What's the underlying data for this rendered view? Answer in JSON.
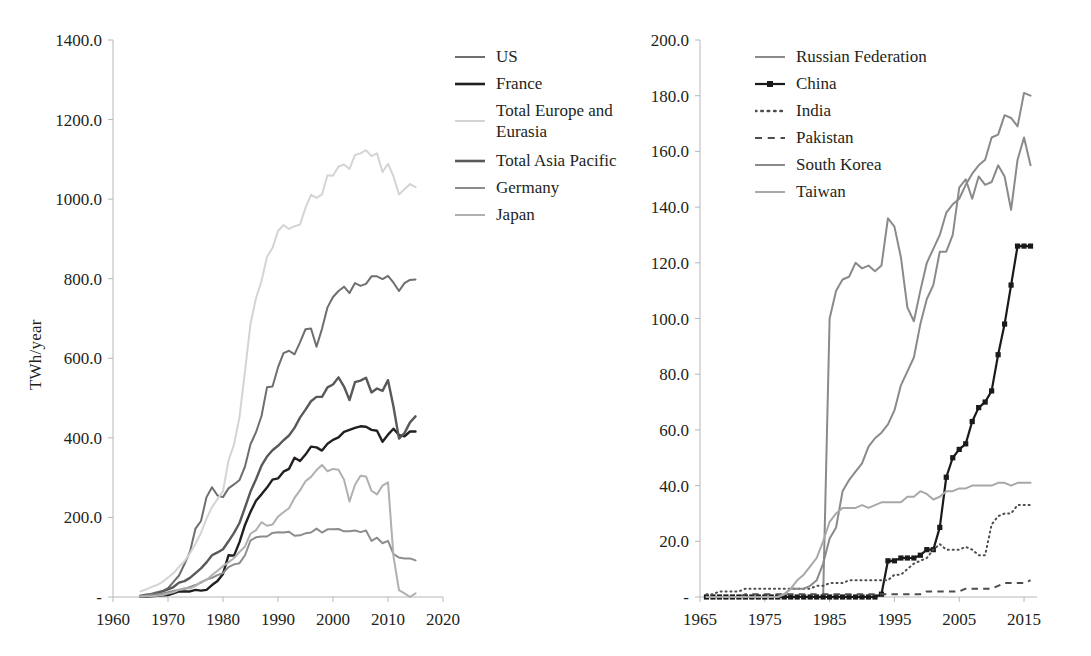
{
  "chart_data": [
    {
      "id": "left",
      "type": "line",
      "title": "",
      "xlabel": "",
      "ylabel": "TWh/year",
      "xlim": [
        1960,
        2020
      ],
      "ylim": [
        0,
        1400
      ],
      "xticks": [
        "1960",
        "1970",
        "1980",
        "1990",
        "2000",
        "2010",
        "2020"
      ],
      "xtick_values": [
        1960,
        1970,
        1980,
        1990,
        2000,
        2010,
        2020
      ],
      "yticks": [
        "-",
        "200.0",
        "400.0",
        "600.0",
        "800.0",
        "1000.0",
        "1200.0",
        "1400.0"
      ],
      "ytick_values": [
        0,
        200,
        400,
        600,
        800,
        1000,
        1200,
        1400
      ],
      "grid": false,
      "legend_position": "right",
      "x": [
        1965,
        1966,
        1967,
        1968,
        1969,
        1970,
        1971,
        1972,
        1973,
        1974,
        1975,
        1976,
        1977,
        1978,
        1979,
        1980,
        1981,
        1982,
        1983,
        1984,
        1985,
        1986,
        1987,
        1988,
        1989,
        1990,
        1991,
        1992,
        1993,
        1994,
        1995,
        1996,
        1997,
        1998,
        1999,
        2000,
        2001,
        2002,
        2003,
        2004,
        2005,
        2006,
        2007,
        2008,
        2009,
        2010,
        2011,
        2012,
        2013,
        2014,
        2015
      ],
      "series": [
        {
          "name": "US",
          "color": "#6e6e6e",
          "width": 2.0,
          "style": "solid",
          "values": [
            4,
            6,
            8,
            12,
            15,
            22,
            38,
            54,
            83,
            114,
            172,
            191,
            251,
            276,
            255,
            251,
            273,
            283,
            294,
            328,
            384,
            414,
            455,
            527,
            529,
            577,
            613,
            619,
            610,
            640,
            673,
            675,
            629,
            674,
            728,
            754,
            769,
            780,
            764,
            789,
            782,
            787,
            806,
            806,
            799,
            807,
            790,
            769,
            789,
            797,
            798
          ]
        },
        {
          "name": "France",
          "color": "#231f20",
          "width": 2.4,
          "style": "solid",
          "values": [
            1,
            1,
            2,
            3,
            4,
            5,
            9,
            14,
            14,
            14,
            18,
            16,
            18,
            30,
            40,
            58,
            105,
            104,
            138,
            181,
            214,
            242,
            258,
            275,
            295,
            298,
            315,
            322,
            350,
            342,
            358,
            378,
            376,
            368,
            385,
            395,
            401,
            415,
            420,
            425,
            429,
            428,
            420,
            418,
            390,
            408,
            423,
            407,
            404,
            416,
            416
          ]
        },
        {
          "name": "Total Europe and Eurasia",
          "color": "#d4d4d4",
          "width": 2.0,
          "style": "solid",
          "values": [
            14,
            19,
            25,
            30,
            38,
            49,
            60,
            76,
            90,
            110,
            134,
            161,
            197,
            226,
            246,
            266,
            343,
            383,
            452,
            568,
            687,
            751,
            794,
            855,
            877,
            920,
            935,
            925,
            932,
            936,
            978,
            1011,
            1003,
            1012,
            1060,
            1059,
            1082,
            1087,
            1076,
            1111,
            1115,
            1123,
            1108,
            1115,
            1068,
            1089,
            1057,
            1012,
            1025,
            1038,
            1030
          ]
        },
        {
          "name": "Total Asia Pacific",
          "color": "#595959",
          "width": 2.4,
          "style": "solid",
          "values": [
            1,
            2,
            5,
            9,
            14,
            19,
            25,
            36,
            40,
            48,
            60,
            72,
            87,
            105,
            112,
            120,
            140,
            161,
            186,
            225,
            265,
            296,
            330,
            353,
            369,
            380,
            394,
            406,
            425,
            451,
            471,
            492,
            503,
            503,
            527,
            534,
            552,
            529,
            495,
            540,
            544,
            551,
            514,
            524,
            518,
            545,
            478,
            398,
            412,
            439,
            454
          ]
        },
        {
          "name": "Germany",
          "color": "#8c8c8c",
          "width": 2.0,
          "style": "solid",
          "values": [
            2,
            3,
            5,
            7,
            9,
            12,
            15,
            18,
            20,
            25,
            30,
            36,
            44,
            48,
            55,
            60,
            75,
            82,
            85,
            105,
            142,
            150,
            152,
            152,
            161,
            163,
            162,
            164,
            154,
            155,
            160,
            162,
            172,
            162,
            170,
            170,
            171,
            165,
            165,
            167,
            163,
            167,
            141,
            149,
            135,
            141,
            108,
            99,
            97,
            97,
            92
          ]
        },
        {
          "name": "Japan",
          "color": "#b0b0b0",
          "width": 2.0,
          "style": "solid",
          "values": [
            1,
            2,
            2,
            3,
            5,
            9,
            12,
            18,
            22,
            22,
            28,
            38,
            43,
            55,
            66,
            78,
            87,
            98,
            113,
            127,
            159,
            168,
            188,
            179,
            182,
            202,
            213,
            223,
            249,
            268,
            291,
            302,
            319,
            332,
            316,
            322,
            320,
            295,
            240,
            282,
            305,
            303,
            267,
            258,
            280,
            288,
            102,
            17,
            9,
            0,
            9
          ]
        }
      ]
    },
    {
      "id": "right",
      "type": "line",
      "title": "",
      "xlabel": "",
      "ylabel": "",
      "xlim": [
        1965,
        2017
      ],
      "ylim": [
        0,
        200
      ],
      "xticks": [
        "1965",
        "1975",
        "1985",
        "1995",
        "2005",
        "2015"
      ],
      "xtick_values": [
        1965,
        1975,
        1985,
        1995,
        2005,
        2015
      ],
      "yticks": [
        "-",
        "20.0",
        "40.0",
        "60.0",
        "80.0",
        "100.0",
        "120.0",
        "140.0",
        "160.0",
        "180.0",
        "200.0"
      ],
      "ytick_values": [
        0,
        20,
        40,
        60,
        80,
        100,
        120,
        140,
        160,
        180,
        200
      ],
      "grid": false,
      "legend_position": "right",
      "x": [
        1966,
        1967,
        1968,
        1969,
        1970,
        1971,
        1972,
        1973,
        1974,
        1975,
        1976,
        1977,
        1978,
        1979,
        1980,
        1981,
        1982,
        1983,
        1984,
        1985,
        1986,
        1987,
        1988,
        1989,
        1990,
        1991,
        1992,
        1993,
        1994,
        1995,
        1996,
        1997,
        1998,
        1999,
        2000,
        2001,
        2002,
        2003,
        2004,
        2005,
        2006,
        2007,
        2008,
        2009,
        2010,
        2011,
        2012,
        2013,
        2014,
        2015,
        2016
      ],
      "series": [
        {
          "name": "Russian Federation",
          "color": "#8a8a8a",
          "width": 2.0,
          "style": "solid",
          "markers": false,
          "values": [
            0,
            0,
            0,
            0,
            0,
            0,
            0,
            0,
            0,
            0,
            0,
            0,
            0,
            0,
            0,
            0,
            0,
            0,
            0,
            100,
            110,
            114,
            115,
            120,
            118,
            119,
            117,
            119,
            136,
            133,
            122,
            104,
            99,
            110,
            120,
            125,
            130,
            138,
            141,
            143,
            148,
            152,
            155,
            157,
            165,
            166,
            173,
            172,
            169,
            181,
            180
          ]
        },
        {
          "name": "China",
          "color": "#1a1a1a",
          "width": 2.2,
          "style": "solid",
          "markers": true,
          "values": [
            0,
            0,
            0,
            0,
            0,
            0,
            0,
            0,
            0,
            0,
            0,
            0,
            0,
            0,
            0,
            0,
            0,
            0,
            0,
            0,
            0,
            0,
            0,
            0,
            0,
            0,
            0,
            1,
            13,
            13,
            14,
            14,
            14,
            15,
            17,
            17,
            25,
            43,
            50,
            53,
            55,
            63,
            68,
            70,
            74,
            87,
            98,
            112,
            126,
            126,
            126
          ]
        },
        {
          "name": "India",
          "color": "#4d4d4d",
          "width": 2.0,
          "style": "dotted",
          "markers": false,
          "values": [
            1,
            1,
            2,
            2,
            2,
            2,
            3,
            3,
            3,
            3,
            3,
            3,
            3,
            3,
            3,
            3,
            3,
            4,
            4,
            5,
            5,
            5,
            6,
            6,
            6,
            6,
            6,
            6,
            6,
            8,
            8,
            10,
            12,
            13,
            14,
            17,
            19,
            17,
            17,
            17,
            18,
            17,
            15,
            15,
            26,
            29,
            30,
            30,
            33,
            33,
            33
          ]
        },
        {
          "name": "Pakistan",
          "color": "#4d4d4d",
          "width": 2.0,
          "style": "dashed",
          "markers": false,
          "values": [
            0,
            0,
            0,
            0,
            0,
            0,
            1,
            1,
            1,
            1,
            1,
            1,
            1,
            1,
            1,
            1,
            1,
            1,
            1,
            1,
            1,
            1,
            1,
            1,
            1,
            1,
            1,
            1,
            1,
            1,
            1,
            1,
            1,
            1,
            2,
            2,
            2,
            2,
            2,
            2,
            3,
            3,
            3,
            3,
            3,
            4,
            5,
            5,
            5,
            5,
            6
          ]
        },
        {
          "name": "South Korea",
          "color": "#8a8a8a",
          "width": 2.0,
          "style": "solid",
          "markers": false,
          "values": [
            0,
            0,
            0,
            0,
            0,
            0,
            0,
            0,
            0,
            0,
            0,
            0,
            1,
            3,
            3,
            3,
            4,
            6,
            12,
            21,
            25,
            38,
            42,
            45,
            48,
            54,
            57,
            59,
            62,
            67,
            76,
            81,
            86,
            98,
            107,
            112,
            124,
            124,
            130,
            147,
            150,
            143,
            151,
            148,
            149,
            155,
            151,
            139,
            157,
            165,
            155
          ]
        },
        {
          "name": "Taiwan",
          "color": "#a8a8a8",
          "width": 2.0,
          "style": "solid",
          "markers": false,
          "values": [
            0,
            0,
            0,
            0,
            0,
            0,
            0,
            0,
            0,
            0,
            0,
            0,
            1,
            3,
            6,
            8,
            11,
            14,
            20,
            27,
            30,
            32,
            32,
            32,
            33,
            32,
            33,
            34,
            34,
            34,
            34,
            36,
            36,
            38,
            37,
            35,
            36,
            38,
            38,
            39,
            39,
            40,
            40,
            40,
            40,
            41,
            41,
            40,
            41,
            41,
            41
          ]
        }
      ]
    }
  ],
  "left_chart": {
    "ylabel": "TWh/year",
    "legend": [
      {
        "label": "US",
        "color": "#6e6e6e",
        "style": "solid",
        "width": 2.0,
        "markers": false
      },
      {
        "label": "France",
        "color": "#231f20",
        "style": "solid",
        "width": 2.6,
        "markers": false
      },
      {
        "label": "Total Europe and\nEurasia",
        "color": "#d4d4d4",
        "style": "solid",
        "width": 2.0,
        "markers": false
      },
      {
        "label": "Total Asia Pacific",
        "color": "#595959",
        "style": "solid",
        "width": 2.6,
        "markers": false
      },
      {
        "label": "Germany",
        "color": "#8c8c8c",
        "style": "solid",
        "width": 2.0,
        "markers": false
      },
      {
        "label": "Japan",
        "color": "#b0b0b0",
        "style": "solid",
        "width": 2.0,
        "markers": false
      }
    ]
  },
  "right_chart": {
    "ylabel": "",
    "legend": [
      {
        "label": "Russian Federation",
        "color": "#8a8a8a",
        "style": "solid",
        "width": 2.0,
        "markers": false
      },
      {
        "label": "China",
        "color": "#1a1a1a",
        "style": "solid",
        "width": 2.2,
        "markers": true
      },
      {
        "label": "India",
        "color": "#4d4d4d",
        "style": "dotted",
        "width": 2.6,
        "markers": false
      },
      {
        "label": "Pakistan",
        "color": "#4d4d4d",
        "style": "dashed",
        "width": 2.2,
        "markers": false
      },
      {
        "label": "South Korea",
        "color": "#8a8a8a",
        "style": "solid",
        "width": 2.0,
        "markers": false
      },
      {
        "label": "Taiwan",
        "color": "#a8a8a8",
        "style": "solid",
        "width": 2.0,
        "markers": false
      }
    ]
  }
}
